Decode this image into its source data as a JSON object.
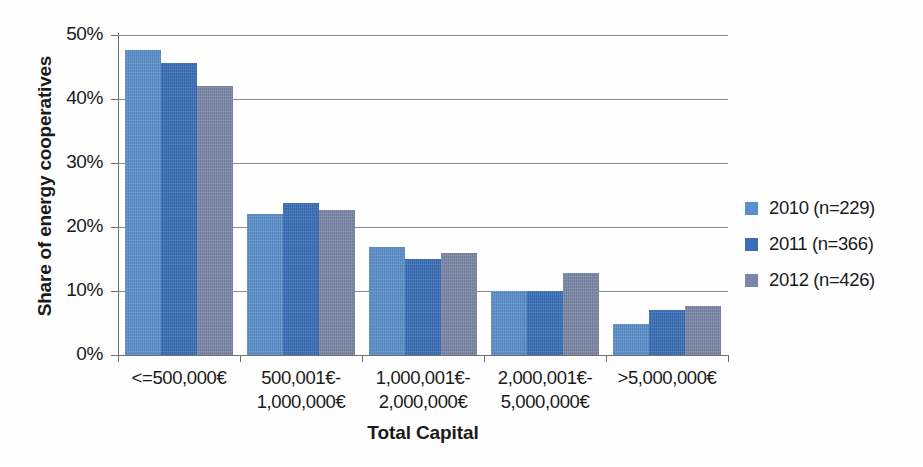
{
  "chart_data": {
    "type": "bar",
    "title": "",
    "xlabel": "Total Capital",
    "ylabel": "Share of energy cooperatives",
    "categories": [
      "<=500,000€",
      "500,001€-\n1,000,000€",
      "1,000,001€-\n2,000,000€",
      "2,000,001€-\n5,000,000€",
      ">5,000,000€"
    ],
    "series": [
      {
        "name": "2010 (n=229)",
        "color": "#5b8fcb",
        "values": [
          47.7,
          22.0,
          16.8,
          10.0,
          4.8
        ]
      },
      {
        "name": "2011 (n=366)",
        "color": "#3a6fb8",
        "values": [
          45.7,
          23.7,
          15.0,
          10.0,
          7.0
        ]
      },
      {
        "name": "2012 (n=426)",
        "color": "#7b87a8",
        "values": [
          42.0,
          22.6,
          16.0,
          12.8,
          7.7
        ]
      }
    ],
    "ylim": [
      0,
      50
    ],
    "ytick_values": [
      0,
      10,
      20,
      30,
      40,
      50
    ],
    "ytick_labels": [
      "0%",
      "10%",
      "20%",
      "30%",
      "40%",
      "50%"
    ],
    "grid": true,
    "legend_position": "right"
  }
}
